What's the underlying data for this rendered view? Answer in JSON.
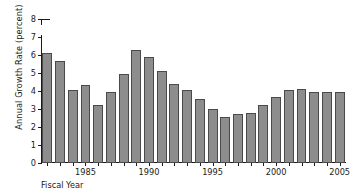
{
  "chart_data": {
    "type": "bar",
    "title": "",
    "xlabel": "Fiscal Year",
    "ylabel": "Annual Growth Rate (percent)",
    "categories": [
      1982,
      1983,
      1984,
      1985,
      1986,
      1987,
      1988,
      1989,
      1990,
      1991,
      1992,
      1993,
      1994,
      1995,
      1996,
      1997,
      1998,
      1999,
      2000,
      2001,
      2002,
      2003,
      2004,
      2005
    ],
    "values": [
      6.1,
      5.65,
      4.05,
      4.35,
      3.25,
      3.95,
      4.95,
      6.3,
      5.9,
      5.1,
      4.4,
      4.05,
      3.55,
      3.0,
      2.55,
      2.7,
      2.8,
      3.2,
      3.65,
      4.05,
      4.1,
      3.95,
      3.95,
      3.95
    ],
    "ylim": [
      0,
      8
    ],
    "yticks": [
      0,
      1,
      2,
      3,
      4,
      5,
      6,
      7,
      8
    ],
    "ytick_labels": [
      "0",
      "1",
      "2",
      "3",
      "4",
      "5",
      "6",
      "7",
      "8"
    ],
    "xticks": [
      1985,
      1990,
      1995,
      2000,
      2005
    ],
    "xtick_labels": [
      "1985",
      "1990",
      "1995",
      "2000",
      "2005"
    ],
    "axis_break": {
      "between": [
        7,
        8
      ],
      "axis": "y"
    },
    "grid": false,
    "legend": null,
    "bar_color": "#8d8d8d",
    "bar_edge_color": "#4a4a4a",
    "axis_color": "#1a1a1a",
    "background": "#ffffff"
  }
}
